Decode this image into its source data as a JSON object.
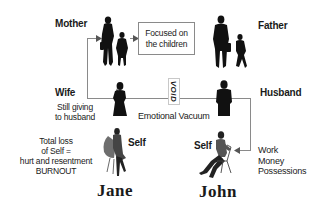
{
  "diagram": {
    "top_row": {
      "left_label": "Mother",
      "center_box": "Focused on the children",
      "center_box_lines": [
        "Focused on",
        "the children"
      ],
      "right_label": "Father"
    },
    "middle_row": {
      "left_label": "Wife",
      "left_note_lines": [
        "Still giving",
        "to husband"
      ],
      "void_label": "VOID",
      "center_caption": "Emotional Vacuum",
      "right_label": "Husband"
    },
    "bottom_row": {
      "left_note_lines": [
        "Total loss",
        "of Self =",
        "hurt and resentment",
        "BURNOUT"
      ],
      "left_self_label": "Self",
      "right_self_label": "Self",
      "right_note_lines": [
        "Work",
        "Money",
        "Possessions"
      ]
    },
    "names": {
      "left": "Jane",
      "right": "John"
    },
    "icons": {
      "mother_with_child": "woman-with-child-silhouette",
      "father_with_child": "man-with-child-silhouette",
      "wife": "woman-silhouette",
      "husband": "man-silhouette",
      "jane_self": "woman-seated-silhouette",
      "john_self": "man-seated-silhouette"
    },
    "colors": {
      "silhouette": "#111111",
      "connector": "#8a8a8a",
      "text": "#1a1a1a",
      "background": "#ffffff"
    }
  }
}
